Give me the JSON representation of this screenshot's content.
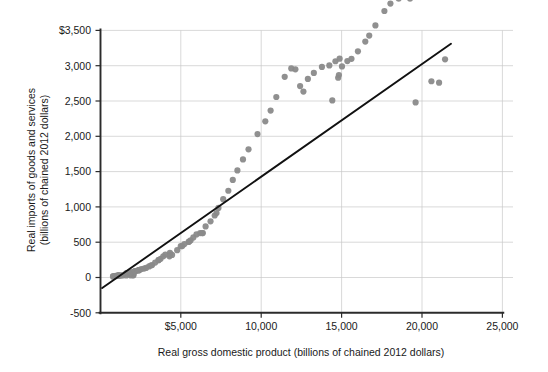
{
  "chart_data": {
    "type": "scatter",
    "title": "",
    "xlabel": "Real gross domestic product (billions of chained 2012 dollars)",
    "ylabel": "Real imports of goods and services\n(billions of chained 2012 dollars)",
    "xlim": [
      0,
      25000
    ],
    "ylim": [
      -500,
      3500
    ],
    "xticks": [
      0,
      5000,
      10000,
      15000,
      20000,
      25000
    ],
    "yticks": [
      -500,
      0,
      500,
      1000,
      1500,
      2000,
      2500,
      3000,
      3500
    ],
    "xtick_labels": [
      "",
      "$5,000",
      "10,000",
      "15,000",
      "20,000",
      "25,000"
    ],
    "ytick_labels": [
      "-500",
      "0",
      "500",
      "1,000",
      "1,500",
      "2,000",
      "2,500",
      "3,000",
      "$3,500"
    ],
    "grid": "horizontal-and-vertical",
    "legend": "none",
    "marker_color": "#8a8a8a",
    "trendline_color": "#111111",
    "trendline": {
      "type": "linear-fit",
      "x_start": 105,
      "y_start": -150,
      "x_end": 21800,
      "y_end": 3310,
      "slope": 0.1595,
      "intercept": -167
    },
    "series": [
      {
        "name": "Real imports vs real GDP",
        "points": [
          [
            1109,
            29
          ],
          [
            1017,
            23
          ],
          [
            906,
            19
          ],
          [
            787,
            15
          ],
          [
            778,
            15
          ],
          [
            846,
            18
          ],
          [
            938,
            22
          ],
          [
            1078,
            26
          ],
          [
            1128,
            29
          ],
          [
            1083,
            22
          ],
          [
            1172,
            26
          ],
          [
            1270,
            29
          ],
          [
            1382,
            30
          ],
          [
            1603,
            28
          ],
          [
            1895,
            28
          ],
          [
            2051,
            31
          ],
          [
            2032,
            34
          ],
          [
            1787,
            45
          ],
          [
            1596,
            60
          ],
          [
            1658,
            62
          ],
          [
            1723,
            63
          ],
          [
            1710,
            64
          ],
          [
            1859,
            73
          ],
          [
            1925,
            69
          ],
          [
            2085,
            75
          ],
          [
            2032,
            77
          ],
          [
            2130,
            86
          ],
          [
            2161,
            88
          ],
          [
            2152,
            90
          ],
          [
            2318,
            99
          ],
          [
            2371,
            103
          ],
          [
            2400,
            105
          ],
          [
            2395,
            104
          ],
          [
            2539,
            119
          ],
          [
            2708,
            126
          ],
          [
            2833,
            136
          ],
          [
            3021,
            157
          ],
          [
            3132,
            170
          ],
          [
            3209,
            177
          ],
          [
            3400,
            212
          ],
          [
            3615,
            247
          ],
          [
            3610,
            246
          ],
          [
            3740,
            264
          ],
          [
            3905,
            301
          ],
          [
            4034,
            325
          ],
          [
            4320,
            348
          ],
          [
            4312,
            322
          ],
          [
            4291,
            300
          ],
          [
            4452,
            320
          ],
          [
            4770,
            387
          ],
          [
            4993,
            444
          ],
          [
            5086,
            445
          ],
          [
            5218,
            474
          ],
          [
            5482,
            504
          ],
          [
            5531,
            512
          ],
          [
            5608,
            527
          ],
          [
            5775,
            568
          ],
          [
            5969,
            610
          ],
          [
            6200,
            629
          ],
          [
            6324,
            629
          ],
          [
            6368,
            629
          ],
          [
            6538,
            723
          ],
          [
            6845,
            796
          ],
          [
            7104,
            878
          ],
          [
            7217,
            913
          ],
          [
            7337,
            986
          ],
          [
            7633,
            1110
          ],
          [
            7952,
            1229
          ],
          [
            8229,
            1382
          ],
          [
            8516,
            1517
          ],
          [
            8863,
            1673
          ],
          [
            9208,
            1816
          ],
          [
            9766,
            2032
          ],
          [
            10251,
            2212
          ],
          [
            10582,
            2364
          ],
          [
            10936,
            2557
          ],
          [
            11458,
            2843
          ],
          [
            11867,
            2962
          ],
          [
            12123,
            2949
          ],
          [
            12416,
            2712
          ],
          [
            12623,
            2634
          ],
          [
            12900,
            2812
          ],
          [
            13271,
            2897
          ],
          [
            13774,
            2983
          ],
          [
            14234,
            3004
          ],
          [
            14614,
            3063
          ],
          [
            14874,
            3100
          ],
          [
            14830,
            2867
          ],
          [
            14419,
            2508
          ],
          [
            14784,
            2829
          ],
          [
            15021,
            2990
          ],
          [
            15355,
            3066
          ],
          [
            15612,
            3098
          ],
          [
            16013,
            3204
          ],
          [
            16472,
            3342
          ],
          [
            16716,
            3427
          ],
          [
            17101,
            3570
          ],
          [
            17660,
            3775
          ],
          [
            18035,
            3880
          ],
          [
            18548,
            3950
          ],
          [
            19091,
            4123
          ],
          [
            19479,
            4253
          ],
          [
            19254,
            3950
          ],
          [
            20894,
            4150
          ],
          [
            21061,
            2760
          ],
          [
            21433,
            3090
          ],
          [
            20584,
            2780
          ],
          [
            19600,
            2480
          ]
        ]
      }
    ],
    "plot_note": "Each marker is one year of U.S. annual data; horizontal axis real GDP, vertical axis real imports."
  }
}
